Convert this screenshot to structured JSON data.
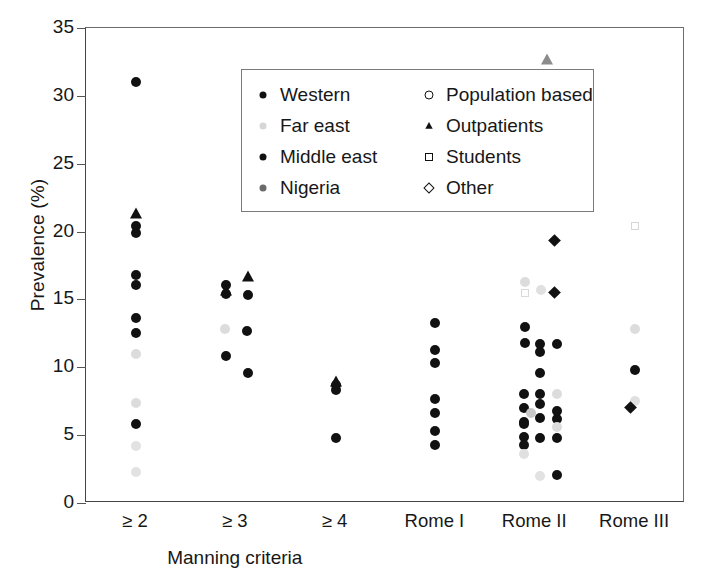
{
  "chart_data": {
    "type": "scatter",
    "title": "",
    "xlabel": "Manning criteria",
    "ylabel": "Prevalence (%)",
    "ylim": [
      0,
      35
    ],
    "yticks": [
      0,
      5,
      10,
      15,
      20,
      25,
      30,
      35
    ],
    "grid": false,
    "legend_position": "top-center-inside",
    "categories": [
      "≥ 2",
      "≥ 3",
      "≥ 4",
      "Rome I",
      "Rome II",
      "Rome III"
    ],
    "group_label_span": [
      "≥ 2",
      "≥ 3",
      "≥ 4"
    ],
    "legend": [
      {
        "label": "Western",
        "marker": "filled-circle",
        "color": "#111111"
      },
      {
        "label": "Population based",
        "marker": "open-circle",
        "color": "#111111"
      },
      {
        "label": "Far east",
        "marker": "filled-circle",
        "color": "#d6d6d6"
      },
      {
        "label": "Outpatients",
        "marker": "filled-triangle",
        "color": "#111111"
      },
      {
        "label": "Middle east",
        "marker": "filled-circle",
        "color": "#111111"
      },
      {
        "label": "Students",
        "marker": "open-square",
        "color": "#111111"
      },
      {
        "label": "Nigeria",
        "marker": "filled-circle",
        "color": "#6a6a6a"
      },
      {
        "label": "Other",
        "marker": "open-diamond",
        "color": "#111111"
      }
    ],
    "series": [
      {
        "name": "≥ 2",
        "category_index": 0,
        "points": [
          {
            "y": 31.0,
            "marker": "filled-circle",
            "color": "#111111",
            "dx": 0
          },
          {
            "y": 21.4,
            "marker": "filled-triangle",
            "color": "#111111",
            "dx": 0
          },
          {
            "y": 20.4,
            "marker": "filled-circle",
            "color": "#111111",
            "dx": 0
          },
          {
            "y": 19.9,
            "marker": "filled-circle",
            "color": "#111111",
            "dx": 0
          },
          {
            "y": 16.8,
            "marker": "filled-circle",
            "color": "#111111",
            "dx": 0
          },
          {
            "y": 16.1,
            "marker": "filled-circle",
            "color": "#111111",
            "dx": 0
          },
          {
            "y": 13.6,
            "marker": "filled-circle",
            "color": "#111111",
            "dx": 0
          },
          {
            "y": 12.5,
            "marker": "filled-circle",
            "color": "#111111",
            "dx": 0
          },
          {
            "y": 11.0,
            "marker": "filled-circle",
            "color": "#dcdcdc",
            "dx": 0
          },
          {
            "y": 7.4,
            "marker": "filled-circle",
            "color": "#dcdcdc",
            "dx": 0
          },
          {
            "y": 5.8,
            "marker": "filled-circle",
            "color": "#111111",
            "dx": 0
          },
          {
            "y": 4.2,
            "marker": "filled-circle",
            "color": "#e2e2e2",
            "dx": 0
          },
          {
            "y": 2.3,
            "marker": "filled-circle",
            "color": "#e2e2e2",
            "dx": 0
          }
        ]
      },
      {
        "name": "≥ 3",
        "category_index": 1,
        "points": [
          {
            "y": 16.7,
            "marker": "filled-triangle",
            "color": "#111111",
            "dx": 12
          },
          {
            "y": 16.1,
            "marker": "filled-circle",
            "color": "#111111",
            "dx": -10
          },
          {
            "y": 15.7,
            "marker": "filled-triangle",
            "color": "#111111",
            "dx": -10
          },
          {
            "y": 15.3,
            "marker": "filled-circle",
            "color": "#111111",
            "dx": 12
          },
          {
            "y": 15.4,
            "marker": "filled-circle",
            "color": "#111111",
            "dx": -10
          },
          {
            "y": 12.8,
            "marker": "filled-circle",
            "color": "#dcdcdc",
            "dx": -11
          },
          {
            "y": 12.7,
            "marker": "filled-circle",
            "color": "#111111",
            "dx": 11
          },
          {
            "y": 10.8,
            "marker": "filled-circle",
            "color": "#111111",
            "dx": -10
          },
          {
            "y": 9.6,
            "marker": "filled-circle",
            "color": "#111111",
            "dx": 12
          }
        ]
      },
      {
        "name": "≥ 4",
        "category_index": 2,
        "points": [
          {
            "y": 9.0,
            "marker": "filled-triangle",
            "color": "#111111",
            "dx": 0
          },
          {
            "y": 8.7,
            "marker": "filled-circle",
            "color": "#111111",
            "dx": 0
          },
          {
            "y": 8.3,
            "marker": "filled-circle",
            "color": "#111111",
            "dx": 0
          },
          {
            "y": 4.8,
            "marker": "filled-circle",
            "color": "#111111",
            "dx": 0
          }
        ]
      },
      {
        "name": "Rome I",
        "category_index": 3,
        "points": [
          {
            "y": 13.3,
            "marker": "filled-circle",
            "color": "#111111",
            "dx": 0
          },
          {
            "y": 11.3,
            "marker": "filled-circle",
            "color": "#111111",
            "dx": 0
          },
          {
            "y": 10.3,
            "marker": "filled-circle",
            "color": "#111111",
            "dx": 0
          },
          {
            "y": 7.7,
            "marker": "filled-circle",
            "color": "#111111",
            "dx": 0
          },
          {
            "y": 6.6,
            "marker": "filled-circle",
            "color": "#111111",
            "dx": 0
          },
          {
            "y": 5.3,
            "marker": "filled-circle",
            "color": "#111111",
            "dx": 0
          },
          {
            "y": 4.3,
            "marker": "filled-circle",
            "color": "#111111",
            "dx": 0
          }
        ]
      },
      {
        "name": "Rome II",
        "category_index": 4,
        "points": [
          {
            "y": 32.7,
            "marker": "filled-triangle",
            "color": "#8c8c8c",
            "dx": 12
          },
          {
            "y": 24.8,
            "marker": "filled-circle",
            "color": "#111111",
            "dx": 8
          },
          {
            "y": 19.0,
            "marker": "filled-diamond",
            "color": "#111111",
            "dx": 24
          },
          {
            "y": 16.3,
            "marker": "filled-circle",
            "color": "#dcdcdc",
            "dx": -10
          },
          {
            "y": 15.5,
            "marker": "open-square",
            "color": "#dadada",
            "dx": -10
          },
          {
            "y": 15.7,
            "marker": "filled-circle",
            "color": "#e0e0e0",
            "dx": 6
          },
          {
            "y": 15.2,
            "marker": "filled-diamond",
            "color": "#111111",
            "dx": 24
          },
          {
            "y": 13.0,
            "marker": "filled-circle",
            "color": "#111111",
            "dx": -10
          },
          {
            "y": 11.8,
            "marker": "filled-circle",
            "color": "#111111",
            "dx": -10
          },
          {
            "y": 11.7,
            "marker": "filled-circle",
            "color": "#111111",
            "dx": 5
          },
          {
            "y": 11.7,
            "marker": "filled-circle",
            "color": "#111111",
            "dx": 22
          },
          {
            "y": 11.1,
            "marker": "filled-circle",
            "color": "#111111",
            "dx": 5
          },
          {
            "y": 9.6,
            "marker": "filled-circle",
            "color": "#111111",
            "dx": 5
          },
          {
            "y": 8.0,
            "marker": "filled-circle",
            "color": "#111111",
            "dx": -11
          },
          {
            "y": 8.0,
            "marker": "filled-circle",
            "color": "#111111",
            "dx": 5
          },
          {
            "y": 8.0,
            "marker": "filled-circle",
            "color": "#dcdcdc",
            "dx": 22
          },
          {
            "y": 7.3,
            "marker": "filled-circle",
            "color": "#111111",
            "dx": 5
          },
          {
            "y": 7.0,
            "marker": "filled-circle",
            "color": "#111111",
            "dx": -11
          },
          {
            "y": 6.8,
            "marker": "filled-circle",
            "color": "#111111",
            "dx": 22
          },
          {
            "y": 6.6,
            "marker": "filled-circle",
            "color": "#c9c9c9",
            "dx": -4
          },
          {
            "y": 6.3,
            "marker": "filled-circle",
            "color": "#111111",
            "dx": 5
          },
          {
            "y": 6.2,
            "marker": "filled-circle",
            "color": "#111111",
            "dx": 22
          },
          {
            "y": 6.0,
            "marker": "filled-circle",
            "color": "#111111",
            "dx": -11
          },
          {
            "y": 5.8,
            "marker": "filled-circle",
            "color": "#111111",
            "dx": -11
          },
          {
            "y": 5.6,
            "marker": "filled-circle",
            "color": "#dcdcdc",
            "dx": 22
          },
          {
            "y": 4.9,
            "marker": "filled-circle",
            "color": "#111111",
            "dx": -11
          },
          {
            "y": 4.8,
            "marker": "filled-circle",
            "color": "#111111",
            "dx": 5
          },
          {
            "y": 4.8,
            "marker": "filled-circle",
            "color": "#111111",
            "dx": 22
          },
          {
            "y": 4.3,
            "marker": "filled-circle",
            "color": "#111111",
            "dx": -11
          },
          {
            "y": 3.6,
            "marker": "filled-circle",
            "color": "#e0e0e0",
            "dx": -11
          },
          {
            "y": 2.1,
            "marker": "filled-circle",
            "color": "#111111",
            "dx": 22
          },
          {
            "y": 2.0,
            "marker": "filled-circle",
            "color": "#e2e2e2",
            "dx": 5
          }
        ]
      },
      {
        "name": "Rome III",
        "category_index": 5,
        "points": [
          {
            "y": 20.4,
            "marker": "open-square",
            "color": "#d6d6d6",
            "dx": 0
          },
          {
            "y": 12.8,
            "marker": "filled-circle",
            "color": "#dcdcdc",
            "dx": 0
          },
          {
            "y": 9.8,
            "marker": "filled-circle",
            "color": "#111111",
            "dx": 0
          },
          {
            "y": 7.5,
            "marker": "filled-circle",
            "color": "#e0e0e0",
            "dx": 0
          },
          {
            "y": 6.7,
            "marker": "filled-diamond",
            "color": "#111111",
            "dx": 0
          }
        ]
      }
    ]
  }
}
